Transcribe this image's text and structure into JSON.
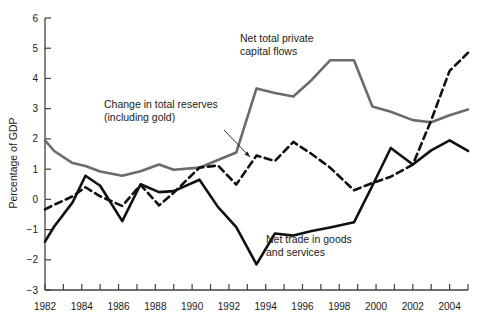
{
  "chart_data": {
    "type": "line",
    "title": "",
    "subtitle": "",
    "xlabel": "",
    "ylabel": "Percentage of GDP",
    "xlim": [
      1982,
      2005
    ],
    "ylim": [
      -3,
      6
    ],
    "grid": false,
    "legend_position": "inline-annotations",
    "y_ticks": [
      -3,
      -2,
      -1,
      0,
      1,
      2,
      3,
      4,
      5,
      6
    ],
    "y_tick_labels": [
      "−3",
      "−2",
      "−1",
      "0",
      "1",
      "2",
      "3",
      "4",
      "5",
      "6"
    ],
    "x_ticks": [
      1982,
      1983,
      1984,
      1985,
      1986,
      1987,
      1988,
      1989,
      1990,
      1991,
      1992,
      1993,
      1994,
      1995,
      1996,
      1997,
      1998,
      1999,
      2000,
      2001,
      2002,
      2003,
      2004,
      2005
    ],
    "x_tick_labels_shown": [
      "1982",
      "1984",
      "1986",
      "1988",
      "1990",
      "1992",
      "1994",
      "1996",
      "1998",
      "2000",
      "2002",
      "2004"
    ],
    "x": [
      1982,
      1982.5,
      1983.5,
      1984.2,
      1985,
      1986.2,
      1987.2,
      1988.2,
      1989,
      1990.4,
      1991.4,
      1992.4,
      1993.5,
      1994.5,
      1995.5,
      1996.5,
      1997.5,
      1998.8,
      1999.8,
      2000.8,
      2002,
      2003,
      2004,
      2005
    ],
    "series": [
      {
        "name": "Net total private capital flows",
        "style": "solid",
        "color": "#6b6b6b",
        "width": 2.6,
        "label_line1": "Net total private",
        "label_line2": "capital flows",
        "values": [
          1.95,
          1.6,
          1.2,
          1.1,
          0.92,
          0.78,
          0.93,
          1.15,
          0.98,
          1.05,
          1.3,
          1.55,
          3.67,
          3.52,
          3.4,
          3.95,
          4.6,
          4.6,
          3.07,
          2.9,
          2.62,
          2.55,
          2.78,
          2.97
        ]
      },
      {
        "name": "Change in total reserves (including gold)",
        "style": "dashed",
        "color": "#101010",
        "width": 2.6,
        "label_line1": "Change in total reserves",
        "label_line2": "(including gold)",
        "values": [
          -0.33,
          -0.18,
          0.1,
          0.4,
          0.1,
          -0.22,
          0.48,
          -0.2,
          0.22,
          1.05,
          1.12,
          0.49,
          1.45,
          1.27,
          1.9,
          1.5,
          1.05,
          0.3,
          0.54,
          0.75,
          1.15,
          2.62,
          4.25,
          4.85
        ]
      },
      {
        "name": "Net trade in goods and services",
        "style": "solid",
        "color": "#101010",
        "width": 2.6,
        "label_line1": "Net trade in goods",
        "label_line2": "and services",
        "values": [
          -1.4,
          -0.9,
          -0.1,
          0.78,
          0.45,
          -0.72,
          0.5,
          0.24,
          0.27,
          0.65,
          -0.25,
          -0.92,
          -2.15,
          -1.13,
          -1.2,
          -1.05,
          -0.93,
          -0.76,
          0.45,
          1.7,
          1.15,
          1.62,
          1.95,
          1.6
        ]
      }
    ],
    "annotations": [
      {
        "id": "annot-private-flows",
        "line1": "Net total private",
        "line2": "capital flows",
        "x_px": 240,
        "y_px": 42,
        "leader": false
      },
      {
        "id": "annot-reserves",
        "line1": "Change in total reserves",
        "line2": "(including gold)",
        "x_px": 104,
        "y_px": 108,
        "leader": true,
        "leader_from": [
          224,
          130
        ],
        "leader_to": [
          250,
          157
        ]
      },
      {
        "id": "annot-net-trade",
        "line1": "Net trade in goods",
        "line2": "and services",
        "x_px": 266,
        "y_px": 243,
        "leader": false
      }
    ],
    "axis_color": "#404040",
    "text_color": "#1a1a1a"
  }
}
